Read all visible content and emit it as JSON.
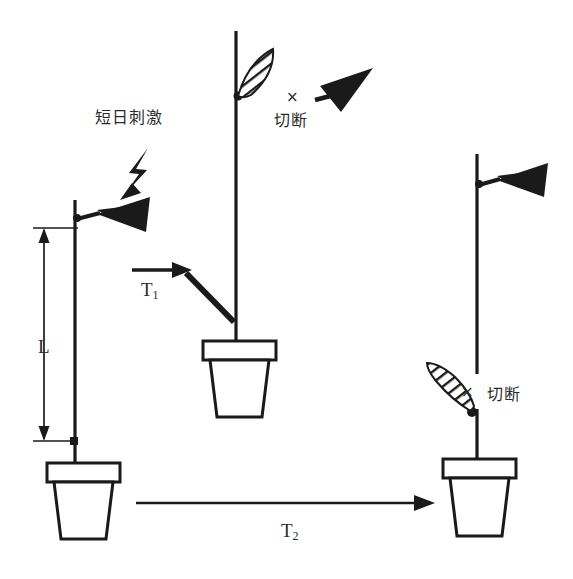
{
  "figure": {
    "background_color": "#ffffff",
    "ink_color": "#1a1a1a",
    "width": 573,
    "height": 579
  },
  "labels": {
    "short_day_stimulus": "短日刺激",
    "cut_middle": "切断",
    "cut_right": "切断",
    "x_mark_middle": "×",
    "x_mark_right": "×",
    "length_L": "L",
    "time_T1": "T",
    "time_T1_sub": "1",
    "time_T2": "T",
    "time_T2_sub": "2"
  },
  "plants": {
    "left": {
      "name": "donor-plant-left",
      "stem_label": "vertical-stem",
      "leaf_type": "solid-black-leaf",
      "dimension_label": "L",
      "pot": "flower-pot"
    },
    "middle": {
      "name": "receptor-plant-middle",
      "leaf_top_type": "hatched-striped-leaf",
      "leaf_removed_type": "solid-black-leaf",
      "cut_label": "切断",
      "pot": "flower-pot"
    },
    "right": {
      "name": "result-plant-right",
      "leaf_top_type": "solid-black-leaf",
      "leaf_bottom_type": "hatched-striped-leaf",
      "cut_label": "切断",
      "pot": "flower-pot"
    }
  },
  "annotations": {
    "lightning_bolt": "lightning-bolt-arrow",
    "arrow_t1": "right-arrow-T1",
    "arrow_t2": "right-arrow-T2",
    "dimension_arrow_L": "double-headed-vertical-arrow"
  }
}
